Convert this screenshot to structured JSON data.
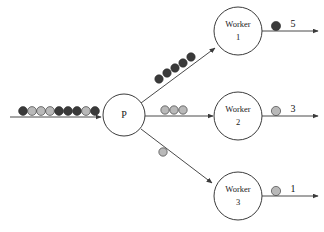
{
  "diagram": {
    "type": "producer-worker-queue-diagram",
    "background": "#ffffff",
    "colors": {
      "dark_token": "#3a3a3a",
      "light_token": "#b9b9b9",
      "edge": "#4a4a4a",
      "node_stroke": "#3c3c3c",
      "node_fill": "#ffffff",
      "text": "#111111"
    },
    "producer": {
      "label": "P",
      "cx": 124,
      "cy": 115,
      "r": 21
    },
    "input_queue": {
      "name": "input-queue",
      "line": {
        "x1": 10,
        "y1": 117,
        "x2": 101,
        "y2": 117
      },
      "token_count": 9,
      "tokens": [
        {
          "shade": "dark",
          "cx": 23,
          "cy": 111,
          "r": 4.4
        },
        {
          "shade": "light",
          "cx": 32,
          "cy": 111,
          "r": 4.4
        },
        {
          "shade": "light",
          "cx": 41,
          "cy": 111,
          "r": 4.4
        },
        {
          "shade": "light",
          "cx": 50,
          "cy": 111,
          "r": 4.4
        },
        {
          "shade": "dark",
          "cx": 59,
          "cy": 111,
          "r": 4.4
        },
        {
          "shade": "dark",
          "cx": 68,
          "cy": 111,
          "r": 4.4
        },
        {
          "shade": "dark",
          "cx": 77,
          "cy": 111,
          "r": 4.4
        },
        {
          "shade": "light",
          "cx": 86,
          "cy": 111,
          "r": 4.4
        },
        {
          "shade": "dark",
          "cx": 95,
          "cy": 111,
          "r": 4.4
        }
      ]
    },
    "branches": [
      {
        "name": "branch-worker-1",
        "line": {
          "x1": 141,
          "y1": 103,
          "x2": 215,
          "y2": 48
        },
        "token_count": 5,
        "token_shade": "dark",
        "tokens": [
          {
            "shade": "dark",
            "cx": 159,
            "cy": 79,
            "r": 4.2
          },
          {
            "shade": "dark",
            "cx": 167,
            "cy": 73,
            "r": 4.2
          },
          {
            "shade": "dark",
            "cx": 175,
            "cy": 68,
            "r": 4.2
          },
          {
            "shade": "dark",
            "cx": 183,
            "cy": 63,
            "r": 4.2
          },
          {
            "shade": "dark",
            "cx": 191,
            "cy": 57,
            "r": 4.2
          }
        ]
      },
      {
        "name": "branch-worker-2",
        "line": {
          "x1": 145,
          "y1": 116,
          "x2": 213,
          "y2": 116
        },
        "token_count": 3,
        "token_shade": "light",
        "tokens": [
          {
            "shade": "light",
            "cx": 165,
            "cy": 110,
            "r": 4.2
          },
          {
            "shade": "light",
            "cx": 174,
            "cy": 110,
            "r": 4.2
          },
          {
            "shade": "light",
            "cx": 183,
            "cy": 110,
            "r": 4.2
          }
        ]
      },
      {
        "name": "branch-worker-3",
        "line": {
          "x1": 141,
          "y1": 129,
          "x2": 212,
          "y2": 183
        },
        "token_count": 1,
        "token_shade": "light",
        "tokens": [
          {
            "shade": "light",
            "cx": 163,
            "cy": 152,
            "r": 4.2
          }
        ]
      }
    ],
    "workers": [
      {
        "name": "worker-1",
        "label_line1": "Worker",
        "label_line2": "1",
        "cx": 238,
        "cy": 31,
        "r": 24,
        "output": {
          "name": "output-worker-1",
          "line": {
            "x1": 262,
            "y1": 31,
            "x2": 318,
            "y2": 31
          },
          "token_shade": "dark",
          "token": {
            "cx": 276,
            "cy": 26,
            "r": 4.6
          },
          "count": "5",
          "count_x": 293,
          "count_y": 25
        }
      },
      {
        "name": "worker-2",
        "label_line1": "Worker",
        "label_line2": "2",
        "cx": 238,
        "cy": 116,
        "r": 24,
        "output": {
          "name": "output-worker-2",
          "line": {
            "x1": 262,
            "y1": 116,
            "x2": 318,
            "y2": 116
          },
          "token_shade": "light",
          "token": {
            "cx": 276,
            "cy": 111,
            "r": 4.6
          },
          "count": "3",
          "count_x": 293,
          "count_y": 110
        }
      },
      {
        "name": "worker-3",
        "label_line1": "Worker",
        "label_line2": "3",
        "cx": 238,
        "cy": 196,
        "r": 24,
        "output": {
          "name": "output-worker-3",
          "line": {
            "x1": 262,
            "y1": 196,
            "x2": 318,
            "y2": 196
          },
          "token_shade": "light",
          "token": {
            "cx": 276,
            "cy": 191,
            "r": 4.6
          },
          "count": "1",
          "count_x": 293,
          "count_y": 190
        }
      }
    ]
  }
}
